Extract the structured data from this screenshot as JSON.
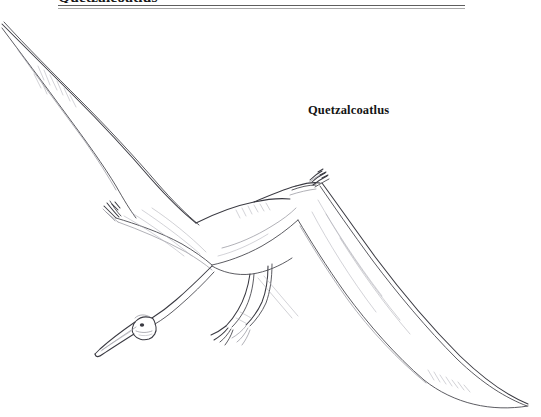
{
  "page": {
    "width": 541,
    "height": 417,
    "background_color": "#ffffff"
  },
  "header": {
    "title": "Quetzalcoatlus",
    "title_clipped": true,
    "rule_color_top": "#5e5e5e",
    "rule_color_bottom": "#a8a8a8"
  },
  "caption": {
    "text": "Quetzalcoatlus"
  },
  "illustration": {
    "subject": "Quetzalcoatlus pterosaur in flight",
    "style": "fine line pen drawing",
    "ink_color": "#4a4a50",
    "ink_color_light": "#8f8f98"
  }
}
